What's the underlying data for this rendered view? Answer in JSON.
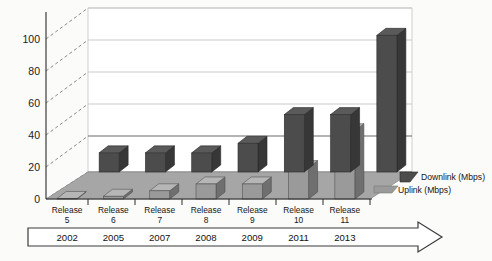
{
  "chart_data": {
    "type": "bar",
    "title": "",
    "subtitle": "",
    "xlabel": "",
    "ylabel": "",
    "categories": [
      "Release\n5",
      "Release\n6",
      "Release\n7",
      "Release\n8",
      "Release\n9",
      "Release\n10",
      "Release\n11"
    ],
    "category_lines": [
      {
        "top": "Release",
        "bottom": "5"
      },
      {
        "top": "Release",
        "bottom": "6"
      },
      {
        "top": "Release",
        "bottom": "7"
      },
      {
        "top": "Release",
        "bottom": "8"
      },
      {
        "top": "Release",
        "bottom": "9"
      },
      {
        "top": "Release",
        "bottom": "10"
      },
      {
        "top": "Release",
        "bottom": "11"
      }
    ],
    "years": [
      "2002",
      "2005",
      "2007",
      "2008",
      "2009",
      "2011",
      "2013"
    ],
    "series": [
      {
        "name": "Downlink (Mbps)",
        "values": [
          14,
          14,
          14,
          21,
          42,
          42,
          100
        ],
        "color": "#4c4c4c"
      },
      {
        "name": "Uplink (Mbps)",
        "values": [
          0.4,
          2,
          6,
          11,
          11,
          23,
          50
        ],
        "color": "#9a9a9a"
      }
    ],
    "ylim": [
      0,
      120
    ],
    "yticks": [
      0,
      20,
      40,
      60,
      80,
      100
    ],
    "ytick_labels": [
      "0",
      "20",
      "40",
      "60",
      "80",
      "100"
    ],
    "grid": true,
    "legend_position": "right",
    "projection": "3d"
  },
  "legend": {
    "entries": [
      {
        "label": "Downlink (Mbps)"
      },
      {
        "label": "Uplink (Mbps)"
      }
    ]
  },
  "timeline": {
    "arrow_label": "time-arrow"
  },
  "background_text": {
    "right_watermark": "",
    "bottom_watermark": ""
  }
}
